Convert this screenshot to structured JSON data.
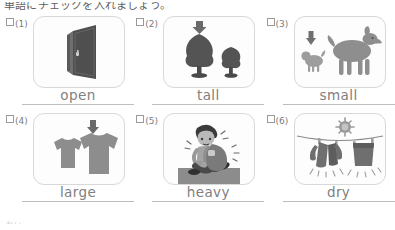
{
  "worksheet": {
    "heading": "単語にチェックを入れましょう。",
    "foot_mark": "れい",
    "colors": {
      "ink": "#6e6e6e",
      "word": "#808080",
      "card_border": "#d8d8d8",
      "rule": "#bdbdbd",
      "art_dark": "#4a4a4a",
      "art_mid": "#7d7d7d",
      "art_light": "#a8a8a8",
      "ground": "#8c8c8c"
    },
    "checkbox_icon": "empty-checkbox-icon",
    "items": [
      {
        "number": "(1)",
        "word": "open",
        "art": "door-icon",
        "checked": false
      },
      {
        "number": "(2)",
        "word": "tall",
        "art": "trees-icon",
        "checked": false
      },
      {
        "number": "(3)",
        "word": "small",
        "art": "dogs-icon",
        "checked": false
      },
      {
        "number": "(4)",
        "word": "large",
        "art": "t-shirts-icon",
        "checked": false
      },
      {
        "number": "(5)",
        "word": "heavy",
        "art": "heavy-bag-icon",
        "checked": false
      },
      {
        "number": "(6)",
        "word": "dry",
        "art": "clothesline-icon",
        "checked": false
      }
    ]
  }
}
